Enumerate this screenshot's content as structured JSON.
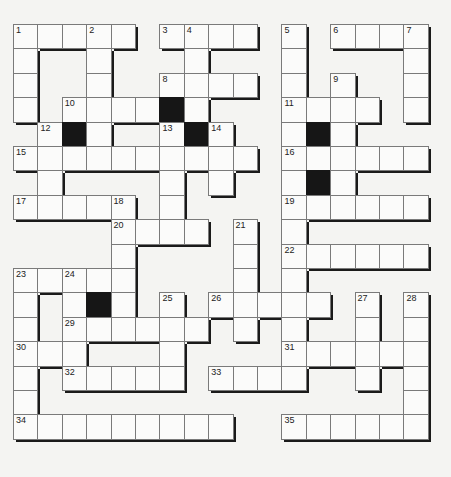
{
  "puzzle": {
    "type": "crossword",
    "origin": [
      13,
      24
    ],
    "cell_size": 24.4,
    "rows": 17,
    "cols": 17,
    "colors": {
      "cell": "#fbfbfa",
      "black": "#161616",
      "border": "#7a7a7a",
      "shadow": "#1a1a1a",
      "background": "#f4f4f2"
    },
    "cells": [
      [
        0,
        0,
        "1"
      ],
      [
        0,
        1
      ],
      [
        0,
        2
      ],
      [
        0,
        3,
        "2"
      ],
      [
        0,
        4
      ],
      [
        0,
        6,
        "3"
      ],
      [
        0,
        7,
        "4"
      ],
      [
        0,
        8
      ],
      [
        0,
        9
      ],
      [
        0,
        11,
        "5"
      ],
      [
        0,
        13,
        "6"
      ],
      [
        0,
        14
      ],
      [
        0,
        15
      ],
      [
        0,
        16,
        "7"
      ],
      [
        1,
        0
      ],
      [
        1,
        3
      ],
      [
        1,
        7
      ],
      [
        1,
        11
      ],
      [
        1,
        16
      ],
      [
        2,
        0
      ],
      [
        2,
        3
      ],
      [
        2,
        6,
        "8"
      ],
      [
        2,
        7
      ],
      [
        2,
        8
      ],
      [
        2,
        9
      ],
      [
        2,
        11
      ],
      [
        2,
        13,
        "9"
      ],
      [
        2,
        16
      ],
      [
        3,
        0
      ],
      [
        3,
        2,
        "10"
      ],
      [
        3,
        3
      ],
      [
        3,
        4
      ],
      [
        3,
        5
      ],
      [
        3,
        6,
        null,
        "black"
      ],
      [
        3,
        7
      ],
      [
        3,
        11,
        "11"
      ],
      [
        3,
        12
      ],
      [
        3,
        13
      ],
      [
        3,
        14
      ],
      [
        3,
        16
      ],
      [
        4,
        1,
        "12"
      ],
      [
        4,
        2,
        null,
        "black"
      ],
      [
        4,
        3
      ],
      [
        4,
        6,
        "13"
      ],
      [
        4,
        7,
        null,
        "black"
      ],
      [
        4,
        8,
        "14"
      ],
      [
        4,
        11
      ],
      [
        4,
        12,
        null,
        "black"
      ],
      [
        4,
        13
      ],
      [
        5,
        0,
        "15"
      ],
      [
        5,
        1
      ],
      [
        5,
        2
      ],
      [
        5,
        3
      ],
      [
        5,
        4
      ],
      [
        5,
        5
      ],
      [
        5,
        6
      ],
      [
        5,
        7
      ],
      [
        5,
        8
      ],
      [
        5,
        9
      ],
      [
        5,
        11,
        "16"
      ],
      [
        5,
        12
      ],
      [
        5,
        13
      ],
      [
        5,
        14
      ],
      [
        5,
        15
      ],
      [
        5,
        16
      ],
      [
        6,
        1
      ],
      [
        6,
        6
      ],
      [
        6,
        8
      ],
      [
        6,
        11
      ],
      [
        6,
        12,
        null,
        "black"
      ],
      [
        6,
        13
      ],
      [
        7,
        0,
        "17"
      ],
      [
        7,
        1
      ],
      [
        7,
        2
      ],
      [
        7,
        3
      ],
      [
        7,
        4,
        "18"
      ],
      [
        7,
        6
      ],
      [
        7,
        11,
        "19"
      ],
      [
        7,
        12
      ],
      [
        7,
        13
      ],
      [
        7,
        14
      ],
      [
        7,
        15
      ],
      [
        7,
        16
      ],
      [
        8,
        4,
        "20"
      ],
      [
        8,
        5
      ],
      [
        8,
        6
      ],
      [
        8,
        7
      ],
      [
        8,
        9,
        "21"
      ],
      [
        8,
        11
      ],
      [
        9,
        4
      ],
      [
        9,
        9
      ],
      [
        9,
        11,
        "22"
      ],
      [
        9,
        12
      ],
      [
        9,
        13
      ],
      [
        9,
        14
      ],
      [
        9,
        15
      ],
      [
        9,
        16
      ],
      [
        10,
        0,
        "23"
      ],
      [
        10,
        1
      ],
      [
        10,
        2,
        "24"
      ],
      [
        10,
        3
      ],
      [
        10,
        4
      ],
      [
        10,
        9
      ],
      [
        10,
        11
      ],
      [
        11,
        0
      ],
      [
        11,
        2
      ],
      [
        11,
        3,
        null,
        "black"
      ],
      [
        11,
        4
      ],
      [
        11,
        6,
        "25"
      ],
      [
        11,
        8,
        "26"
      ],
      [
        11,
        9
      ],
      [
        11,
        10
      ],
      [
        11,
        11
      ],
      [
        11,
        12
      ],
      [
        11,
        14,
        "27"
      ],
      [
        11,
        16,
        "28"
      ],
      [
        12,
        0
      ],
      [
        12,
        2,
        "29"
      ],
      [
        12,
        3
      ],
      [
        12,
        4
      ],
      [
        12,
        5
      ],
      [
        12,
        6
      ],
      [
        12,
        7
      ],
      [
        12,
        9
      ],
      [
        12,
        11
      ],
      [
        12,
        14
      ],
      [
        12,
        16
      ],
      [
        13,
        0,
        "30"
      ],
      [
        13,
        1
      ],
      [
        13,
        2
      ],
      [
        13,
        6
      ],
      [
        13,
        11,
        "31"
      ],
      [
        13,
        12
      ],
      [
        13,
        13
      ],
      [
        13,
        14
      ],
      [
        13,
        15
      ],
      [
        13,
        16
      ],
      [
        14,
        0
      ],
      [
        14,
        2,
        "32"
      ],
      [
        14,
        3
      ],
      [
        14,
        4
      ],
      [
        14,
        5
      ],
      [
        14,
        6
      ],
      [
        14,
        8,
        "33"
      ],
      [
        14,
        9
      ],
      [
        14,
        10
      ],
      [
        14,
        11
      ],
      [
        14,
        14
      ],
      [
        14,
        16
      ],
      [
        15,
        0
      ],
      [
        15,
        16
      ],
      [
        16,
        0,
        "34"
      ],
      [
        16,
        1
      ],
      [
        16,
        2
      ],
      [
        16,
        3
      ],
      [
        16,
        4
      ],
      [
        16,
        5
      ],
      [
        16,
        6
      ],
      [
        16,
        7
      ],
      [
        16,
        8
      ],
      [
        16,
        11,
        "35"
      ],
      [
        16,
        12
      ],
      [
        16,
        13
      ],
      [
        16,
        14
      ],
      [
        16,
        15
      ],
      [
        16,
        16
      ]
    ],
    "clue_numbers": [
      "1",
      "2",
      "3",
      "4",
      "5",
      "6",
      "7",
      "8",
      "9",
      "10",
      "11",
      "12",
      "13",
      "14",
      "15",
      "16",
      "17",
      "18",
      "19",
      "20",
      "21",
      "22",
      "23",
      "24",
      "25",
      "26",
      "27",
      "28",
      "29",
      "30",
      "31",
      "32",
      "33",
      "34",
      "35"
    ]
  }
}
